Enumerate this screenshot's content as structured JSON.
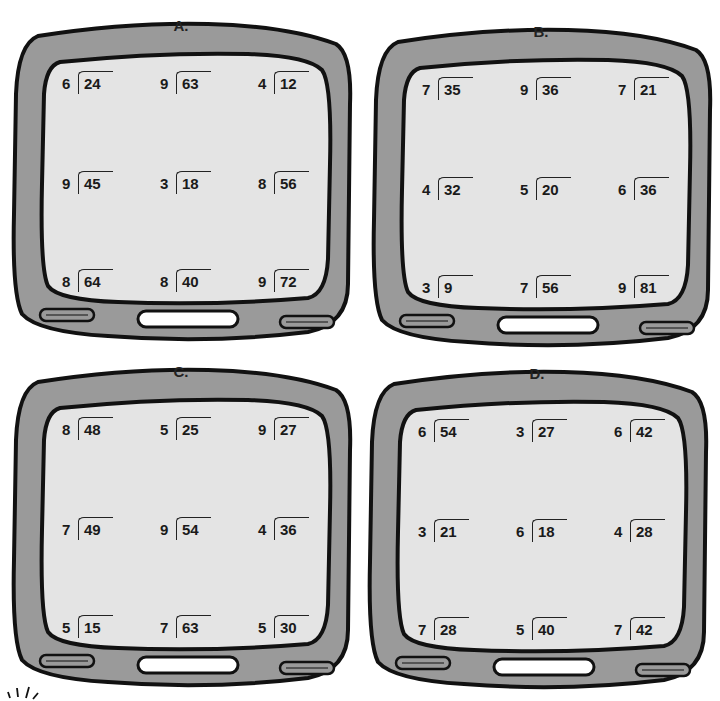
{
  "panels": [
    {
      "label": "A.",
      "problems": [
        {
          "divisor": "6",
          "dividend": "24"
        },
        {
          "divisor": "9",
          "dividend": "63"
        },
        {
          "divisor": "4",
          "dividend": "12"
        },
        {
          "divisor": "9",
          "dividend": "45"
        },
        {
          "divisor": "3",
          "dividend": "18"
        },
        {
          "divisor": "8",
          "dividend": "56"
        },
        {
          "divisor": "8",
          "dividend": "64"
        },
        {
          "divisor": "8",
          "dividend": "40"
        },
        {
          "divisor": "9",
          "dividend": "72"
        }
      ]
    },
    {
      "label": "B.",
      "problems": [
        {
          "divisor": "7",
          "dividend": "35"
        },
        {
          "divisor": "9",
          "dividend": "36"
        },
        {
          "divisor": "7",
          "dividend": "21"
        },
        {
          "divisor": "4",
          "dividend": "32"
        },
        {
          "divisor": "5",
          "dividend": "20"
        },
        {
          "divisor": "6",
          "dividend": "36"
        },
        {
          "divisor": "3",
          "dividend": "9"
        },
        {
          "divisor": "7",
          "dividend": "56"
        },
        {
          "divisor": "9",
          "dividend": "81"
        }
      ]
    },
    {
      "label": "C.",
      "problems": [
        {
          "divisor": "8",
          "dividend": "48"
        },
        {
          "divisor": "5",
          "dividend": "25"
        },
        {
          "divisor": "9",
          "dividend": "27"
        },
        {
          "divisor": "7",
          "dividend": "49"
        },
        {
          "divisor": "9",
          "dividend": "54"
        },
        {
          "divisor": "4",
          "dividend": "36"
        },
        {
          "divisor": "5",
          "dividend": "15"
        },
        {
          "divisor": "7",
          "dividend": "63"
        },
        {
          "divisor": "5",
          "dividend": "30"
        }
      ]
    },
    {
      "label": "D.",
      "problems": [
        {
          "divisor": "6",
          "dividend": "54"
        },
        {
          "divisor": "3",
          "dividend": "27"
        },
        {
          "divisor": "6",
          "dividend": "42"
        },
        {
          "divisor": "3",
          "dividend": "21"
        },
        {
          "divisor": "6",
          "dividend": "18"
        },
        {
          "divisor": "4",
          "dividend": "28"
        },
        {
          "divisor": "7",
          "dividend": "28"
        },
        {
          "divisor": "5",
          "dividend": "40"
        },
        {
          "divisor": "7",
          "dividend": "42"
        }
      ]
    }
  ],
  "colors": {
    "frame": "#9a9a9a",
    "screen": "#e4e4e4",
    "outline": "#111111",
    "button": "#ffffff"
  }
}
